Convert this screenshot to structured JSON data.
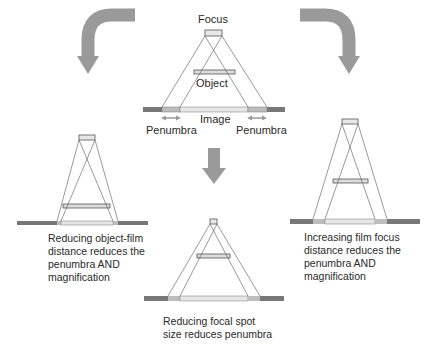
{
  "colors": {
    "arrow": "#9a9a9a",
    "film_dark": "#777777",
    "penumbra": "#bdbdbd",
    "image": "#e6e6e6",
    "ray": "#555555",
    "box_fill": "#dcdcdc"
  },
  "top": {
    "focus_label": "Focus",
    "object_label": "Object",
    "image_label": "Image",
    "penumbra_left_label": "Penumbra",
    "penumbra_right_label": "Penumbra"
  },
  "panels": {
    "left": {
      "caption_lines": [
        "Reducing object-film",
        "distance reduces the",
        "penumbra AND",
        "magnification"
      ]
    },
    "center": {
      "caption_lines": [
        "Reducing focal spot",
        "size reduces penumbra"
      ]
    },
    "right": {
      "caption_lines": [
        "Increasing film focus",
        "distance reduces the",
        "penumbra AND",
        "magnification"
      ]
    }
  }
}
